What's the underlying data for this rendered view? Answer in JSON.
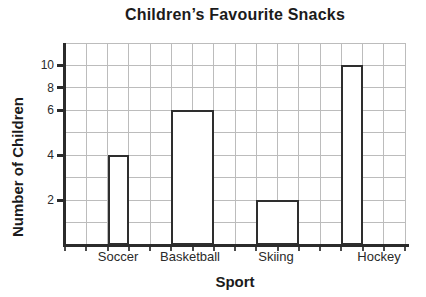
{
  "chart_data": {
    "type": "bar",
    "title": "Children’s Favourite Snacks",
    "xlabel": "Sport",
    "ylabel": "Number of Children",
    "categories": [
      "Soccer",
      "Basketball",
      "Skiing",
      "Hockey"
    ],
    "values": [
      4,
      6,
      2,
      10
    ],
    "y_tick_labels": [
      "10",
      "8",
      "6",
      "4",
      "2"
    ],
    "ylim": [
      0,
      10
    ],
    "grid": "on",
    "legend": "none",
    "bar_fill": "#ffffff",
    "bar_outline": "#2e2e2e",
    "grid_color": "#bcbcbc",
    "axis_color": "#2b2b2b",
    "layout": {
      "plot": {
        "left": 65,
        "top": 43,
        "width": 340,
        "height": 202
      },
      "cols": 16,
      "rows": 9,
      "y_labels": [
        {
          "row": 1,
          "label": "10"
        },
        {
          "row": 2,
          "label": "8"
        },
        {
          "row": 3,
          "label": "6"
        },
        {
          "row": 5,
          "label": "4"
        },
        {
          "row": 7,
          "label": "2"
        }
      ],
      "bars": [
        {
          "category": "Soccer",
          "col": 2,
          "colspan": 1,
          "top_row": 5,
          "label_center_x": 118
        },
        {
          "category": "Basketball",
          "col": 5,
          "colspan": 2,
          "top_row": 3,
          "label_center_x": 190
        },
        {
          "category": "Skiing",
          "col": 9,
          "colspan": 2,
          "top_row": 7,
          "label_center_x": 276
        },
        {
          "category": "Hockey",
          "col": 13,
          "colspan": 1,
          "top_row": 1,
          "label_center_x": 379
        }
      ]
    }
  }
}
